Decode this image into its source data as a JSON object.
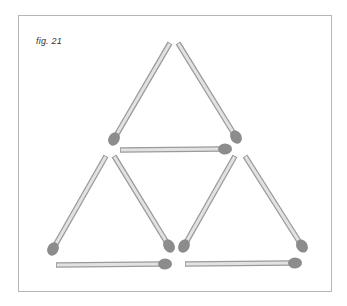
{
  "figure": {
    "caption": "fig. 21",
    "colors": {
      "stick_fill": "#e2e2e2",
      "stick_outline": "#9a9a9a",
      "head": "#8c8c8c",
      "frame": "#b5b5b5"
    },
    "matches": [
      {
        "id": "top-left",
        "tail": [
          170,
          43
        ],
        "head": [
          114,
          139
        ]
      },
      {
        "id": "top-right",
        "tail": [
          178,
          43
        ],
        "head": [
          236,
          137
        ]
      },
      {
        "id": "middle-horizontal",
        "tail": [
          120,
          150
        ],
        "head": [
          225,
          149
        ]
      },
      {
        "id": "bottom-left-left",
        "tail": [
          106,
          156
        ],
        "head": [
          53,
          249
        ]
      },
      {
        "id": "bottom-left-right",
        "tail": [
          114,
          156
        ],
        "head": [
          169,
          246
        ]
      },
      {
        "id": "bottom-right-left",
        "tail": [
          235,
          156
        ],
        "head": [
          184,
          246
        ]
      },
      {
        "id": "bottom-right-right",
        "tail": [
          245,
          156
        ],
        "head": [
          302,
          246
        ]
      },
      {
        "id": "bottom-left-base",
        "tail": [
          56,
          265
        ],
        "head": [
          165,
          264
        ]
      },
      {
        "id": "bottom-right-base",
        "tail": [
          185,
          264
        ],
        "head": [
          295,
          263
        ]
      }
    ]
  }
}
